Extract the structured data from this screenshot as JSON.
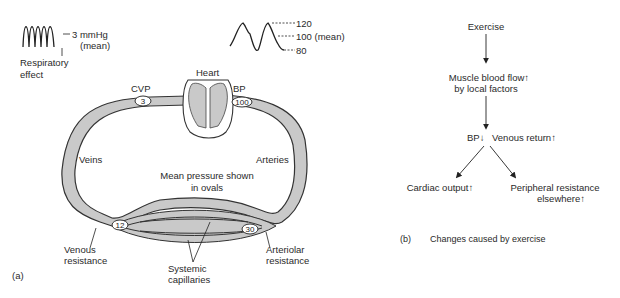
{
  "panel_a": {
    "label": "(a)",
    "venous_trace": {
      "value_label": "3 mmHg",
      "mean_label": "(mean)",
      "caption_line1": "Respiratory",
      "caption_line2": "effect"
    },
    "arterial_trace": {
      "systolic": "120",
      "mean": "100 (mean)",
      "diastolic": "80"
    },
    "heart_label": "Heart",
    "cvp_label": "CVP",
    "bp_label": "BP",
    "ovals": {
      "cvp": "3",
      "bp": "100",
      "venous": "12",
      "arteriolar": "30"
    },
    "veins_label": "Veins",
    "arteries_label": "Arteries",
    "note_line1": "Mean pressure shown",
    "note_line2": "in ovals",
    "venous_resistance_line1": "Venous",
    "venous_resistance_line2": "resistance",
    "arteriolar_resistance_line1": "Arteriolar",
    "arteriolar_resistance_line2": "resistance",
    "capillaries_line1": "Systemic",
    "capillaries_line2": "capillaries",
    "colors": {
      "vessel_fill": "#c9c9c9",
      "outline": "#333333"
    }
  },
  "panel_b": {
    "label": "(b)",
    "caption": "Changes caused by exercise",
    "nodes": {
      "exercise": "Exercise",
      "muscle_line1": "Muscle blood flow↑",
      "muscle_line2": "by local factors",
      "bp": "BP↓",
      "venous_return": "Venous return↑",
      "cardiac_output": "Cardiac output↑",
      "peripheral_line1": "Peripheral resistance",
      "peripheral_line2": "elsewhere↑"
    }
  }
}
